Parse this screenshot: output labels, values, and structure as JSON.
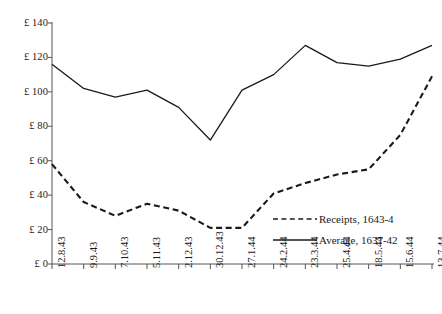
{
  "chart_data": {
    "type": "line",
    "title": "",
    "subtitle": "",
    "xlabel": "",
    "ylabel": "",
    "grid": false,
    "legend_position": "inside-bottom-right",
    "x": [
      "12.8.43",
      "9.9.43",
      "7.10.43",
      "5.11.43",
      "2.12.43",
      "30.12.43",
      "27.1.44",
      "24.2.44",
      "23.3.44",
      "25.4.44",
      "18.5.44",
      "15.6.44",
      "13.7.44"
    ],
    "categories": [
      "12.8.43",
      "9.9.43",
      "7.10.43",
      "5.11.43",
      "2.12.43",
      "30.12.43",
      "27.1.44",
      "24.2.44",
      "23.3.44",
      "25.4.44",
      "18.5.44",
      "15.6.44",
      "13.7.44"
    ],
    "ylim": [
      0,
      140
    ],
    "ytick_values": [
      0,
      20,
      40,
      60,
      80,
      100,
      120,
      140
    ],
    "ytick_labels": [
      "£ 0",
      "£ 20",
      "£ 40",
      "£ 60",
      "£ 80",
      "£ 100",
      "£ 120",
      "£ 140"
    ],
    "series": [
      {
        "name": "Receipts, 1643-4",
        "style": "dashed",
        "color": "#1a1a1a",
        "values": [
          58,
          36,
          28,
          35,
          31,
          21,
          21,
          41,
          47,
          52,
          55,
          75,
          109
        ]
      },
      {
        "name": "Average, 1637-42",
        "style": "solid",
        "color": "#1a1a1a",
        "values": [
          116,
          102,
          97,
          101,
          91,
          72,
          101,
          110,
          127,
          117,
          115,
          119,
          127
        ]
      }
    ],
    "legend": [
      {
        "label": "Receipts, 1643-4",
        "style": "dashed"
      },
      {
        "label": "Average, 1637-42",
        "style": "solid"
      }
    ],
    "axis_color": "#555555"
  }
}
